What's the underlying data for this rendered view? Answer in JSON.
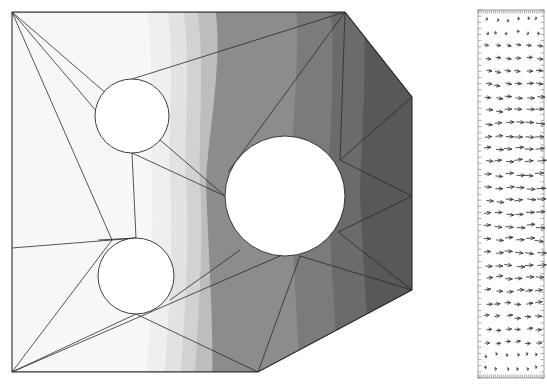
{
  "figure": {
    "title": "",
    "background_color": "#ffffff",
    "panels": [
      {
        "name": "contour-panel",
        "type": "filled-contour-with-mesh"
      },
      {
        "name": "quiver-panel",
        "type": "vector-field"
      }
    ]
  },
  "chart_data": [
    {
      "type": "heatmap",
      "subtype": "filled-contour",
      "title": "",
      "xlabel": "",
      "ylabel": "",
      "grid": false,
      "legend": "none",
      "colormap": "grayscale",
      "colormap_direction": "light-left-to-dark-right",
      "xlim": [
        0,
        412
      ],
      "ylim": [
        0,
        388
      ],
      "domain": {
        "name": "polygonal-domain-with-three-circular-holes",
        "outline": "12,12 345,12 412,97 412,290 258,372 12,372",
        "holes": [
          {
            "name": "hole-upper-left",
            "cx": 132,
            "cy": 116,
            "r": 37
          },
          {
            "name": "hole-lower-left",
            "cx": 136,
            "cy": 276,
            "r": 38
          },
          {
            "name": "hole-center-right",
            "cx": 285,
            "cy": 196,
            "r": 60
          }
        ]
      },
      "contour_levels": [
        1,
        2,
        3,
        4,
        5,
        6,
        7,
        8
      ],
      "contour_band_colors": [
        "#f7f7f7",
        "#ededed",
        "#dedede",
        "#cfcfcf",
        "#8f8f8f",
        "#7c7c7c",
        "#6a6a6a",
        "#565656"
      ],
      "band_boundaries_x": [
        150,
        168,
        182,
        196,
        300,
        330,
        360,
        412
      ],
      "mesh": {
        "visible": true,
        "element_type": "triangle",
        "edge_color": "#2b2b2b",
        "edge_width": 0.7,
        "node_count": 18,
        "triangle_count": 28
      }
    },
    {
      "type": "scatter",
      "subtype": "quiver",
      "title": "",
      "xlabel": "",
      "ylabel": "",
      "grid": false,
      "legend": "none",
      "xlim": [
        0,
        1
      ],
      "ylim": [
        0,
        1
      ],
      "frame": {
        "x": 478,
        "y": 10,
        "width": 66,
        "height": 368
      },
      "arrow_color": "#3a3a3a",
      "tick_marks": {
        "top": 34,
        "bottom": 34,
        "left": 60,
        "right": 60
      },
      "rows": 28,
      "cols": 6,
      "dominant_direction_deg": 0,
      "description": "velocity vectors pointing predominantly to the right"
    }
  ]
}
